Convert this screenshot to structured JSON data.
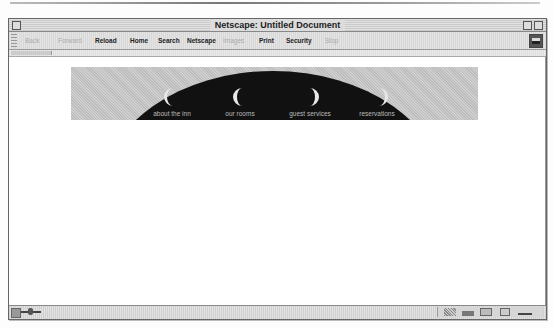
{
  "window": {
    "title": "Netscape: Untitled Document"
  },
  "toolbar": {
    "buttons": [
      {
        "label": "Back",
        "enabled": false
      },
      {
        "label": "Forward",
        "enabled": false
      },
      {
        "label": "Reload",
        "enabled": true
      },
      {
        "label": "Home",
        "enabled": true
      },
      {
        "label": "Search",
        "enabled": true
      },
      {
        "label": "Netscape",
        "enabled": true
      },
      {
        "label": "Images",
        "enabled": false
      },
      {
        "label": "Print",
        "enabled": true
      },
      {
        "label": "Security",
        "enabled": true
      },
      {
        "label": "Stop",
        "enabled": false
      }
    ]
  },
  "banner": {
    "nav_links": [
      {
        "label": "about the inn",
        "moon": "waxing"
      },
      {
        "label": "our rooms",
        "moon": "waxing"
      },
      {
        "label": "guest services",
        "moon": "waning"
      },
      {
        "label": "reservations",
        "moon": "waning"
      }
    ],
    "colors": {
      "background": "#c6c6c6",
      "dome": "#111111",
      "moon": "#e8e8e8",
      "link_text": "#bbbbbb"
    }
  },
  "statusbar": {
    "components": [
      "navigator-icon",
      "mail-icon",
      "composer-icon",
      "address-book-icon",
      "edit-icon"
    ]
  }
}
